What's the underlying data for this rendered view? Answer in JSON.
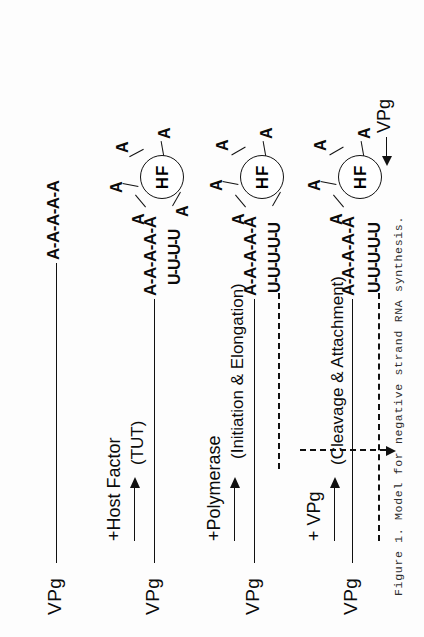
{
  "figure": {
    "caption": "Figure 1. Model for negative strand RNA synthesis.",
    "hf_circle_label": "HF",
    "vpg_label": "VPg",
    "rows": [
      {
        "id": "row-1",
        "vpg": "VPg",
        "template_sequence": "A-A-A-A-A",
        "nascent_sequence": "",
        "has_hf": false,
        "has_dashed_strand": false,
        "radial_bases": []
      },
      {
        "id": "row-2",
        "vpg": "VPg",
        "template_sequence": "A-A-A-A-A",
        "nascent_sequence": "U-U-U-U",
        "has_hf": true,
        "has_dashed_strand": false,
        "radial_bases": [
          "A",
          "A",
          "A",
          "A",
          "A"
        ]
      },
      {
        "id": "row-3",
        "vpg": "VPg",
        "template_sequence": "A-A-A-A-A",
        "nascent_sequence": "U-U-U-U-U",
        "has_hf": true,
        "has_dashed_strand": true,
        "radial_bases": [
          "A",
          "A",
          "A",
          "A"
        ]
      },
      {
        "id": "row-4",
        "vpg": "VPg",
        "template_sequence": "A-A-A-A-A",
        "nascent_sequence": "U-U-U-U-U",
        "has_hf": true,
        "has_dashed_strand": true,
        "radial_bases": [
          "A",
          "A",
          "A",
          "A"
        ],
        "attached_vpg_label": "VPg"
      }
    ],
    "transitions": [
      {
        "id": "transition-1",
        "main_label": "+Host Factor",
        "sub_label": "(TUT)",
        "arrow_style": "solid"
      },
      {
        "id": "transition-2",
        "main_label": "+Polymerase",
        "sub_label": "(Initiation & Elongation)",
        "arrow_style": "solid"
      },
      {
        "id": "transition-3",
        "main_label": "+ VPg",
        "sub_label": "(Cleavage & Attachment)",
        "arrow_style": "solid"
      }
    ]
  },
  "colors": {
    "ink": "#111111",
    "caption_ink": "#2d2d2d",
    "page": "#fdfdfd"
  }
}
